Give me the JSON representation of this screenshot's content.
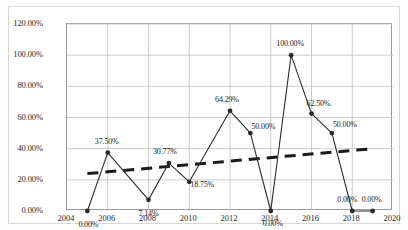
{
  "chart_data": {
    "type": "line",
    "title": "",
    "subtitle": "",
    "xlabel": "",
    "ylabel": "",
    "xlim": [
      2004,
      2020
    ],
    "ylim": [
      0,
      120
    ],
    "grid": true,
    "legend": "none",
    "x_ticks": [
      "2004",
      "2006",
      "2008",
      "2010",
      "2012",
      "2014",
      "2016",
      "2018",
      "2020"
    ],
    "x_tick_values": [
      2004,
      2006,
      2008,
      2010,
      2012,
      2014,
      2016,
      2018,
      2020
    ],
    "y_ticks": [
      "0.00%",
      "20.00%",
      "40.00%",
      "60.00%",
      "80.00%",
      "100.00%",
      "120.00%"
    ],
    "y_tick_values": [
      0,
      20,
      40,
      60,
      80,
      100,
      120
    ],
    "x": [
      2005,
      2006,
      2008,
      2009,
      2010,
      2012,
      2013,
      2014,
      2015,
      2016,
      2017,
      2018,
      2019
    ],
    "series": [
      {
        "name": "percentage-series",
        "marker": "circle",
        "color": "#2b2b2b",
        "values": [
          0.0,
          37.5,
          7.14,
          30.77,
          18.75,
          64.29,
          50.0,
          0.0,
          100.0,
          62.5,
          50.0,
          0.0,
          0.0
        ],
        "data_labels": [
          "0.00%",
          "37.50%",
          "7.14%",
          "30.77%",
          "18.75%",
          "64.29%",
          "50.00%",
          "0.00%",
          "100.00%",
          "62.50%",
          "50.00%",
          "0.00%",
          "0.00%"
        ]
      }
    ],
    "trendline": {
      "name": "linear-trendline",
      "style": "dashed",
      "color": "#1a1a1a",
      "x_start": 2005,
      "x_end": 2019,
      "y_start": 24.0,
      "y_end": 40.0
    },
    "label_offsets": [
      {
        "dx": 2,
        "dy": 14
      },
      {
        "dx": 0,
        "dy": -11
      },
      {
        "dx": 1,
        "dy": 14
      },
      {
        "dx": -3,
        "dy": -11
      },
      {
        "dx": 14,
        "dy": 3
      },
      {
        "dx": -2,
        "dy": -11
      },
      {
        "dx": 14,
        "dy": -6
      },
      {
        "dx": 3,
        "dy": 13
      },
      {
        "dx": 0,
        "dy": -11
      },
      {
        "dx": 8,
        "dy": -10
      },
      {
        "dx": 14,
        "dy": -8
      },
      {
        "dx": -4,
        "dy": -11
      },
      {
        "dx": 0,
        "dy": -11
      }
    ]
  },
  "colors": {
    "series": "#2b2b2b",
    "trendline": "#1a1a1a",
    "grid": "#bfbfbf",
    "axis": "#9a9a9a",
    "text": "#2b2b2b",
    "background": "#ffffff",
    "frame": "#d8d8d8"
  }
}
